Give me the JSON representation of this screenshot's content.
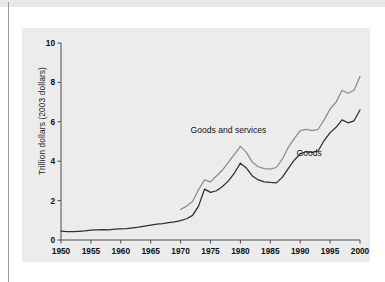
{
  "figure": {
    "background_color": "#ececec",
    "page_color": "#ffffff",
    "top_band_color": "#e8e8e8",
    "left_rule_color": "#9a9a9a"
  },
  "chart_data": {
    "type": "line",
    "title": "",
    "xlabel": "",
    "ylabel": "Trillion dollars (2003 dollars)",
    "xlim": [
      1950,
      2000
    ],
    "ylim": [
      0,
      10
    ],
    "xticks": [
      1950,
      1955,
      1960,
      1965,
      1970,
      1975,
      1980,
      1985,
      1990,
      1995,
      2000
    ],
    "xtick_labels": [
      "1950",
      "1955",
      "1960",
      "1965",
      "1970",
      "1975",
      "1980",
      "1985",
      "1990",
      "1995",
      "2000"
    ],
    "yticks": [
      0,
      2,
      4,
      6,
      8,
      10
    ],
    "ytick_labels": [
      "0",
      "2",
      "4",
      "6",
      "8",
      "10"
    ],
    "grid": false,
    "legend_position": "inline-annotations",
    "series": [
      {
        "name": "Goods and services",
        "color": "#8c8c8c",
        "label_x": 1978.0,
        "label_y": 5.45,
        "x": [
          1970,
          1971,
          1972,
          1973,
          1974,
          1975,
          1976,
          1977,
          1978,
          1979,
          1980,
          1981,
          1982,
          1983,
          1984,
          1985,
          1986,
          1987,
          1988,
          1989,
          1990,
          1991,
          1992,
          1993,
          1994,
          1995,
          1996,
          1997,
          1998,
          1999,
          2000
        ],
        "values": [
          1.55,
          1.72,
          1.95,
          2.55,
          3.05,
          2.95,
          3.25,
          3.55,
          3.95,
          4.35,
          4.75,
          4.45,
          3.95,
          3.72,
          3.62,
          3.6,
          3.68,
          4.1,
          4.7,
          5.15,
          5.55,
          5.62,
          5.55,
          5.62,
          6.1,
          6.65,
          7.0,
          7.6,
          7.45,
          7.6,
          8.3
        ]
      },
      {
        "name": "Goods",
        "color": "#2e2e2e",
        "label_x": 1991.5,
        "label_y": 4.25,
        "x": [
          1950,
          1951,
          1952,
          1953,
          1954,
          1955,
          1956,
          1957,
          1958,
          1959,
          1960,
          1961,
          1962,
          1963,
          1964,
          1965,
          1966,
          1967,
          1968,
          1969,
          1970,
          1971,
          1972,
          1973,
          1974,
          1975,
          1976,
          1977,
          1978,
          1979,
          1980,
          1981,
          1982,
          1983,
          1984,
          1985,
          1986,
          1987,
          1988,
          1989,
          1990,
          1991,
          1992,
          1993,
          1994,
          1995,
          1996,
          1997,
          1998,
          1999,
          2000
        ],
        "values": [
          0.45,
          0.43,
          0.42,
          0.44,
          0.46,
          0.5,
          0.52,
          0.53,
          0.52,
          0.55,
          0.57,
          0.58,
          0.62,
          0.65,
          0.7,
          0.75,
          0.8,
          0.83,
          0.88,
          0.92,
          0.98,
          1.08,
          1.25,
          1.72,
          2.58,
          2.42,
          2.5,
          2.72,
          3.0,
          3.4,
          3.9,
          3.65,
          3.25,
          3.05,
          2.95,
          2.92,
          2.9,
          3.18,
          3.62,
          4.05,
          4.38,
          4.48,
          4.45,
          4.52,
          5.05,
          5.45,
          5.72,
          6.1,
          5.95,
          6.05,
          6.6
        ]
      }
    ]
  }
}
